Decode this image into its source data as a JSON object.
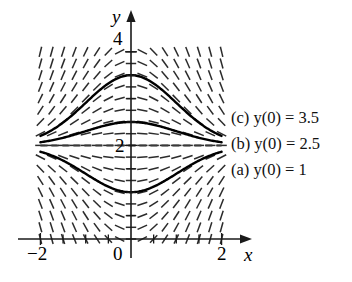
{
  "figure": {
    "kind": "slope-field-with-solution-curves",
    "equation_family": "dy/dx = -x(y - 2)",
    "equilibrium_y": 2
  },
  "axes": {
    "x_name": "x",
    "y_name": "y",
    "x_ticks": [
      {
        "value": -2,
        "label": "−2"
      },
      {
        "value": 0,
        "label": "0"
      },
      {
        "value": 2,
        "label": "2"
      }
    ],
    "y_ticks": [
      {
        "value": 2,
        "label": "2"
      },
      {
        "value": 4,
        "label": "4"
      }
    ],
    "xlim": [
      -2.35,
      2.35
    ],
    "ylim": [
      -0.25,
      4.35
    ],
    "minor_tick_step": 0.5,
    "grid": false
  },
  "labels": {
    "curve_c": "(c) y(0) = 3.5",
    "curve_b": "(b) y(0) = 2.5",
    "curve_a": "(a) y(0) = 1"
  },
  "chart_data": {
    "type": "line",
    "title": "",
    "xlabel": "x",
    "ylabel": "y",
    "xlim": [
      -2.35,
      2.35
    ],
    "ylim": [
      -0.25,
      4.35
    ],
    "grid": false,
    "legend_position": "right",
    "field": {
      "type": "slope-field",
      "slope_formula": "-x*(y-2)",
      "x_range": [
        -2.0,
        2.0
      ],
      "y_range": [
        0.0,
        4.0
      ],
      "x_step": 0.25,
      "y_step": 0.25
    },
    "series": [
      {
        "name": "(c) y(0) = 3.5",
        "initial_condition": {
          "x": 0,
          "y": 3.5
        },
        "formula": "y = 2 + 1.5*exp(-x^2/2)",
        "x": [
          -2.0,
          -1.75,
          -1.5,
          -1.25,
          -1.0,
          -0.75,
          -0.5,
          -0.25,
          0.0,
          0.25,
          0.5,
          0.75,
          1.0,
          1.25,
          1.5,
          1.75,
          2.0
        ],
        "values": [
          2.203,
          2.326,
          2.488,
          2.671,
          2.91,
          3.109,
          3.323,
          3.455,
          3.5,
          3.455,
          3.323,
          3.109,
          2.91,
          2.671,
          2.488,
          2.326,
          2.203
        ]
      },
      {
        "name": "(b) y(0) = 2.5",
        "initial_condition": {
          "x": 0,
          "y": 2.5
        },
        "formula": "y = 2 + 0.5*exp(-x^2/2)",
        "x": [
          -2.0,
          -1.75,
          -1.5,
          -1.25,
          -1.0,
          -0.75,
          -0.5,
          -0.25,
          0.0,
          0.25,
          0.5,
          0.75,
          1.0,
          1.25,
          1.5,
          1.75,
          2.0
        ],
        "values": [
          2.068,
          2.109,
          2.163,
          2.224,
          2.303,
          2.37,
          2.441,
          2.485,
          2.5,
          2.485,
          2.441,
          2.37,
          2.303,
          2.224,
          2.163,
          2.109,
          2.068
        ]
      },
      {
        "name": "(a) y(0) = 1",
        "initial_condition": {
          "x": 0,
          "y": 1
        },
        "formula": "y = 2 - 1.0*exp(-x^2/2)",
        "x": [
          -2.0,
          -1.75,
          -1.5,
          -1.25,
          -1.0,
          -0.75,
          -0.5,
          -0.25,
          0.0,
          0.25,
          0.5,
          0.75,
          1.0,
          1.25,
          1.5,
          1.75,
          2.0
        ],
        "values": [
          1.865,
          1.784,
          1.675,
          1.553,
          1.393,
          1.261,
          1.118,
          1.031,
          1.0,
          1.031,
          1.118,
          1.261,
          1.393,
          1.553,
          1.675,
          1.784,
          1.865
        ]
      },
      {
        "name": "equilibrium y = 2",
        "initial_condition": {
          "x": 0,
          "y": 2
        },
        "formula": "y = 2",
        "x": [
          -2.0,
          2.0
        ],
        "values": [
          2.0,
          2.0
        ]
      }
    ]
  }
}
